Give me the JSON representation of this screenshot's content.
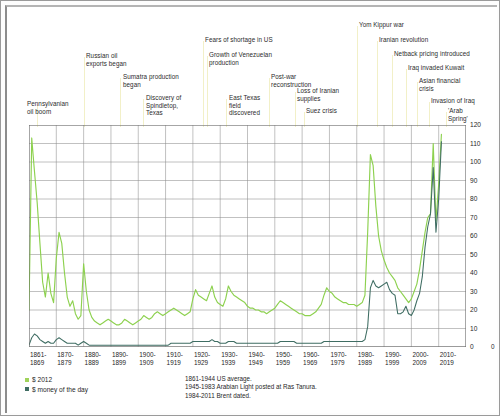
{
  "chart_data": {
    "type": "line",
    "title": "",
    "xlabel": "",
    "ylabel": "",
    "ylim": [
      0,
      120
    ],
    "ytick_step": 10,
    "grid": true,
    "legend_position": "bottom-left",
    "x_start_year": 1861,
    "x_end_year": 2011,
    "yticks": [
      "120",
      "110",
      "100",
      "90",
      "80",
      "70",
      "60",
      "50",
      "40",
      "30",
      "20",
      "10",
      "0"
    ],
    "xticks": [
      "1861-\n1869",
      "1870-\n1879",
      "1880-\n1889",
      "1890-\n1899",
      "1900-\n1909",
      "1910-\n1919",
      "1920-\n1929",
      "1930-\n1939",
      "1940-\n1949",
      "1950-\n1959",
      "1960-\n1969",
      "1970-\n1979",
      "1980-\n1989",
      "1990-\n1999",
      "2000-\n2009",
      "2010-\n2019"
    ],
    "series": [
      {
        "name": "$ 2012",
        "color": "#8dd14f",
        "values": [
          20,
          113,
          95,
          78,
          56,
          35,
          27,
          40,
          29,
          24,
          48,
          62,
          56,
          40,
          27,
          22,
          25,
          18,
          15,
          17,
          45,
          30,
          20,
          16,
          14,
          13,
          12,
          13,
          14,
          15,
          14,
          13,
          12,
          12,
          13,
          15,
          14,
          13,
          12,
          13,
          14,
          15,
          17,
          16,
          15,
          16,
          18,
          19,
          18,
          17,
          18,
          19,
          20,
          21,
          20,
          19,
          18,
          17,
          18,
          19,
          26,
          31,
          28,
          27,
          26,
          25,
          29,
          33,
          27,
          24,
          23,
          22,
          26,
          33,
          30,
          28,
          27,
          26,
          25,
          24,
          22,
          21,
          21,
          20,
          20,
          19,
          19,
          18,
          19,
          20,
          21,
          23,
          25,
          24,
          23,
          22,
          21,
          20,
          19,
          18,
          18,
          17,
          17,
          17,
          18,
          19,
          21,
          23,
          28,
          32,
          30,
          29,
          27,
          26,
          25,
          24,
          24,
          23,
          23,
          23,
          22,
          23,
          24,
          28,
          62,
          104,
          98,
          76,
          60,
          52,
          47,
          43,
          40,
          38,
          36,
          32,
          30,
          28,
          26,
          24,
          26,
          30,
          34,
          42,
          52,
          62,
          70,
          72,
          110,
          68,
          88,
          115
        ]
      },
      {
        "name": "$ money of the day",
        "color": "#3f6d63",
        "values": [
          1,
          5,
          7,
          6,
          4,
          3,
          2,
          3,
          2,
          2,
          4,
          5,
          4,
          3,
          2,
          2,
          2,
          2,
          1,
          2,
          3,
          2,
          1,
          1,
          1,
          1,
          1,
          1,
          1,
          1,
          1,
          1,
          1,
          1,
          1,
          1,
          1,
          1,
          1,
          1,
          1,
          1,
          1,
          1,
          1,
          1,
          1,
          1,
          1,
          1,
          1,
          1,
          2,
          2,
          2,
          2,
          2,
          2,
          2,
          2,
          3,
          3,
          3,
          3,
          3,
          3,
          3,
          4,
          3,
          3,
          2,
          2,
          2,
          3,
          3,
          3,
          2,
          2,
          2,
          2,
          2,
          2,
          2,
          2,
          2,
          2,
          2,
          2,
          2,
          2,
          2,
          2,
          3,
          3,
          3,
          3,
          3,
          3,
          2,
          2,
          2,
          2,
          2,
          2,
          2,
          2,
          2,
          2,
          3,
          3,
          3,
          3,
          3,
          3,
          3,
          3,
          3,
          3,
          3,
          3,
          3,
          3,
          3,
          4,
          11,
          32,
          36,
          33,
          32,
          33,
          34,
          35,
          31,
          29,
          28,
          18,
          18,
          19,
          22,
          18,
          17,
          20,
          25,
          29,
          38,
          54,
          65,
          72,
          97,
          62,
          80,
          111
        ]
      }
    ],
    "annotations": [
      {
        "text": "Pennsylvanian\noil boom",
        "x_pct": 3,
        "label_x": 20,
        "label_y": 93,
        "leader_x": 30,
        "leader_top": 98,
        "leader_h": 22
      },
      {
        "text": "Russian oil\nexports began",
        "x_pct": 14,
        "label_x": 79,
        "label_y": 45,
        "leader_x": 77,
        "leader_top": 50,
        "leader_h": 70
      },
      {
        "text": "Sumatra production\nbegan",
        "x_pct": 20,
        "label_x": 116,
        "label_y": 66,
        "leader_x": 113,
        "leader_top": 71,
        "leader_h": 49
      },
      {
        "text": "Discovery of\nSpindletop,\nTexas",
        "x_pct": 27,
        "label_x": 139,
        "label_y": 87,
        "leader_x": 136,
        "leader_top": 92,
        "leader_h": 28
      },
      {
        "text": "Fears of shortage in US",
        "x_pct": 42,
        "label_x": 198,
        "label_y": 29,
        "leader_x": 196,
        "leader_top": 34,
        "leader_h": 86
      },
      {
        "text": "Growth of Venezuelan\nproduction",
        "x_pct": 44,
        "label_x": 202,
        "label_y": 44,
        "leader_x": 200,
        "leader_top": 49,
        "leader_h": 71
      },
      {
        "text": "East Texas\nfield\ndiscovered",
        "x_pct": 36,
        "label_x": 222,
        "label_y": 87,
        "leader_x": 219,
        "leader_top": 92,
        "leader_h": 28
      },
      {
        "text": "Post-war\nreconstruction",
        "x_pct": 55,
        "label_x": 264,
        "label_y": 66,
        "leader_x": 262,
        "leader_top": 71,
        "leader_h": 49
      },
      {
        "text": "Loss of Iranian\nsupplies",
        "x_pct": 58,
        "label_x": 290,
        "label_y": 80,
        "leader_x": 288,
        "leader_top": 85,
        "leader_h": 35
      },
      {
        "text": "Suez crisis",
        "x_pct": 61,
        "label_x": 299,
        "label_y": 100,
        "leader_x": 297,
        "leader_top": 105,
        "leader_h": 15
      },
      {
        "text": "Yom Kippur war",
        "x_pct": 73,
        "label_x": 352,
        "label_y": 14,
        "leader_x": 350,
        "leader_top": 19,
        "leader_h": 101
      },
      {
        "text": "Iranian revolution",
        "x_pct": 76,
        "label_x": 372,
        "label_y": 29,
        "leader_x": 370,
        "leader_top": 34,
        "leader_h": 86
      },
      {
        "text": "Netback pricing introduced",
        "x_pct": 80,
        "label_x": 387,
        "label_y": 43,
        "leader_x": 385,
        "leader_top": 48,
        "leader_h": 72
      },
      {
        "text": "Iraq invaded Kuwait",
        "x_pct": 84,
        "label_x": 401,
        "label_y": 57,
        "leader_x": 399,
        "leader_top": 62,
        "leader_h": 58
      },
      {
        "text": "Asian financial\ncrisis",
        "x_pct": 88,
        "label_x": 412,
        "label_y": 70,
        "leader_x": 410,
        "leader_top": 75,
        "leader_h": 45
      },
      {
        "text": "Invasion of Iraq",
        "x_pct": 93,
        "label_x": 424,
        "label_y": 90,
        "leader_x": 422,
        "leader_top": 95,
        "leader_h": 25
      },
      {
        "text": "'Arab\nSpring'",
        "x_pct": 97,
        "label_x": 441,
        "label_y": 100,
        "leader_x": 439,
        "leader_top": 105,
        "leader_h": 15
      }
    ],
    "legend": [
      {
        "label": "$ 2012",
        "color": "#9fd35a"
      },
      {
        "label": "$ money of the day",
        "color": "#3f6d63"
      }
    ],
    "notes": [
      "1861-1944 US average.",
      "1945-1983 Arabian Light posted at Ras Tanura.",
      "1984-2011 Brent dated."
    ]
  }
}
